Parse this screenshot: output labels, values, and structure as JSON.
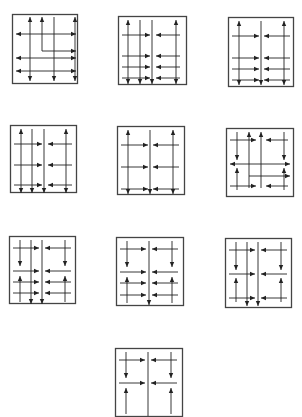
{
  "figure": {
    "stroke_color": "#222222",
    "frame_color": "#444444",
    "panels": [
      {
        "id": 1,
        "x": 12,
        "y": 14,
        "w": 66,
        "h": 70,
        "lines": [
          [
            18,
            3,
            18,
            67,
            "both"
          ],
          [
            30,
            3,
            30,
            37,
            "start"
          ],
          [
            42,
            3,
            42,
            67,
            "end"
          ],
          [
            63,
            3,
            63,
            67,
            "both"
          ],
          [
            4,
            20,
            64,
            20,
            "both"
          ],
          [
            4,
            44,
            64,
            44,
            "both"
          ],
          [
            30,
            37,
            64,
            37,
            "end"
          ],
          [
            4,
            57,
            64,
            57,
            "both"
          ]
        ]
      },
      {
        "id": 2,
        "x": 118,
        "y": 16,
        "w": 69,
        "h": 69,
        "lines": [
          [
            10,
            4,
            10,
            68,
            "both"
          ],
          [
            22,
            4,
            22,
            68,
            "end"
          ],
          [
            34,
            4,
            34,
            68,
            "end"
          ],
          [
            58,
            4,
            58,
            68,
            "both"
          ],
          [
            4,
            19,
            32,
            19,
            "end"
          ],
          [
            62,
            19,
            38,
            19,
            "end"
          ],
          [
            4,
            40,
            32,
            40,
            "end"
          ],
          [
            62,
            40,
            38,
            40,
            "end"
          ],
          [
            4,
            51,
            32,
            51,
            "end"
          ],
          [
            62,
            51,
            38,
            51,
            "end"
          ],
          [
            4,
            62,
            32,
            62,
            "end"
          ],
          [
            62,
            62,
            38,
            62,
            "end"
          ]
        ]
      },
      {
        "id": 3,
        "x": 228,
        "y": 17,
        "w": 66,
        "h": 70,
        "lines": [
          [
            11,
            4,
            11,
            68,
            "both"
          ],
          [
            33,
            4,
            33,
            68,
            "end"
          ],
          [
            56,
            4,
            56,
            68,
            "both"
          ],
          [
            4,
            19,
            31,
            19,
            "end"
          ],
          [
            62,
            19,
            36,
            19,
            "end"
          ],
          [
            4,
            41,
            31,
            41,
            "end"
          ],
          [
            62,
            41,
            36,
            41,
            "end"
          ],
          [
            4,
            52,
            31,
            52,
            "end"
          ],
          [
            62,
            52,
            36,
            52,
            "end"
          ],
          [
            4,
            63,
            31,
            63,
            "end"
          ],
          [
            62,
            63,
            36,
            63,
            "end"
          ]
        ]
      },
      {
        "id": 4,
        "x": 10,
        "y": 125,
        "w": 67,
        "h": 68,
        "lines": [
          [
            11,
            4,
            11,
            68,
            "both"
          ],
          [
            22,
            4,
            22,
            68,
            "end"
          ],
          [
            34,
            4,
            34,
            68,
            "end"
          ],
          [
            56,
            4,
            56,
            68,
            "both"
          ],
          [
            4,
            19,
            32,
            19,
            "end"
          ],
          [
            62,
            19,
            38,
            19,
            "end"
          ],
          [
            4,
            40,
            32,
            40,
            "end"
          ],
          [
            62,
            40,
            38,
            40,
            "end"
          ],
          [
            4,
            60,
            32,
            60,
            "end"
          ],
          [
            62,
            60,
            38,
            60,
            "end"
          ]
        ]
      },
      {
        "id": 5,
        "x": 117,
        "y": 126,
        "w": 68,
        "h": 69,
        "lines": [
          [
            11,
            4,
            11,
            68,
            "both"
          ],
          [
            33,
            4,
            33,
            68,
            "end"
          ],
          [
            56,
            4,
            56,
            68,
            "both"
          ],
          [
            4,
            19,
            31,
            19,
            "end"
          ],
          [
            62,
            19,
            36,
            19,
            "end"
          ],
          [
            4,
            41,
            31,
            41,
            "end"
          ],
          [
            62,
            41,
            36,
            41,
            "end"
          ],
          [
            4,
            63,
            31,
            63,
            "end"
          ],
          [
            62,
            63,
            36,
            63,
            "end"
          ]
        ]
      },
      {
        "id": 6,
        "x": 226,
        "y": 128,
        "w": 68,
        "h": 69,
        "lines": [
          [
            11,
            4,
            11,
            32,
            "end"
          ],
          [
            11,
            62,
            11,
            40,
            "end"
          ],
          [
            23,
            60,
            23,
            4,
            "end"
          ],
          [
            35,
            60,
            35,
            4,
            "end"
          ],
          [
            58,
            4,
            58,
            32,
            "end"
          ],
          [
            58,
            62,
            58,
            40,
            "end"
          ],
          [
            4,
            12,
            30,
            12,
            "end"
          ],
          [
            62,
            12,
            40,
            12,
            "end"
          ],
          [
            4,
            36,
            64,
            36,
            "both"
          ],
          [
            23,
            48,
            64,
            48,
            "end"
          ],
          [
            4,
            58,
            30,
            58,
            "end"
          ],
          [
            62,
            58,
            40,
            58,
            "end"
          ]
        ]
      },
      {
        "id": 7,
        "x": 9,
        "y": 236,
        "w": 67,
        "h": 68,
        "lines": [
          [
            11,
            4,
            11,
            30,
            "end"
          ],
          [
            11,
            66,
            11,
            40,
            "end"
          ],
          [
            22,
            4,
            22,
            68,
            "end"
          ],
          [
            33,
            4,
            33,
            68,
            "end"
          ],
          [
            56,
            4,
            56,
            30,
            "end"
          ],
          [
            56,
            66,
            56,
            40,
            "end"
          ],
          [
            4,
            12,
            30,
            12,
            "end"
          ],
          [
            62,
            12,
            36,
            12,
            "end"
          ],
          [
            4,
            35,
            30,
            35,
            "end"
          ],
          [
            62,
            35,
            36,
            35,
            "end"
          ],
          [
            4,
            46,
            30,
            46,
            "end"
          ],
          [
            62,
            46,
            36,
            46,
            "end"
          ],
          [
            4,
            57,
            30,
            57,
            "end"
          ],
          [
            62,
            57,
            36,
            57,
            "end"
          ]
        ]
      },
      {
        "id": 8,
        "x": 116,
        "y": 237,
        "w": 68,
        "h": 69,
        "lines": [
          [
            11,
            4,
            11,
            30,
            "end"
          ],
          [
            11,
            66,
            11,
            40,
            "end"
          ],
          [
            33,
            4,
            33,
            68,
            "end"
          ],
          [
            56,
            4,
            56,
            30,
            "end"
          ],
          [
            56,
            66,
            56,
            40,
            "end"
          ],
          [
            4,
            12,
            30,
            12,
            "end"
          ],
          [
            62,
            12,
            36,
            12,
            "end"
          ],
          [
            4,
            35,
            30,
            35,
            "end"
          ],
          [
            62,
            35,
            36,
            35,
            "end"
          ],
          [
            4,
            46,
            30,
            46,
            "end"
          ],
          [
            62,
            46,
            36,
            46,
            "end"
          ],
          [
            4,
            58,
            30,
            58,
            "end"
          ],
          [
            62,
            58,
            36,
            58,
            "end"
          ]
        ]
      },
      {
        "id": 9,
        "x": 225,
        "y": 238,
        "w": 67,
        "h": 70,
        "lines": [
          [
            11,
            4,
            11,
            32,
            "end"
          ],
          [
            11,
            64,
            11,
            40,
            "end"
          ],
          [
            22,
            4,
            22,
            68,
            "end"
          ],
          [
            33,
            4,
            33,
            68,
            "end"
          ],
          [
            56,
            4,
            56,
            32,
            "end"
          ],
          [
            56,
            64,
            56,
            40,
            "end"
          ],
          [
            4,
            12,
            30,
            12,
            "end"
          ],
          [
            62,
            12,
            36,
            12,
            "end"
          ],
          [
            4,
            36,
            30,
            36,
            "end"
          ],
          [
            62,
            36,
            36,
            36,
            "end"
          ],
          [
            4,
            60,
            30,
            60,
            "end"
          ],
          [
            62,
            60,
            36,
            60,
            "end"
          ]
        ]
      },
      {
        "id": 10,
        "x": 115,
        "y": 348,
        "w": 68,
        "h": 69,
        "lines": [
          [
            11,
            4,
            11,
            30,
            "end"
          ],
          [
            11,
            66,
            11,
            40,
            "end"
          ],
          [
            33,
            4,
            33,
            68,
            "none"
          ],
          [
            56,
            4,
            56,
            30,
            "end"
          ],
          [
            56,
            66,
            56,
            40,
            "end"
          ],
          [
            4,
            12,
            30,
            12,
            "end"
          ],
          [
            62,
            12,
            36,
            12,
            "end"
          ],
          [
            4,
            35,
            30,
            35,
            "end"
          ],
          [
            62,
            35,
            36,
            35,
            "end"
          ]
        ]
      }
    ]
  }
}
